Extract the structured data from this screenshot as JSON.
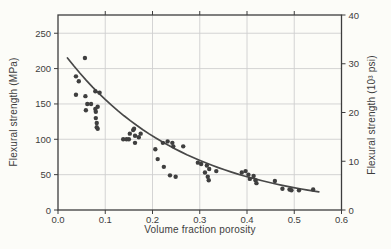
{
  "figure": {
    "background": "#fcfcf8",
    "axis_color": "#3d3d3d",
    "grid_color": "#cfcfcf",
    "point_color": "#3f3f3f",
    "curve_color": "#484848",
    "label_color": "#3d3d3d"
  },
  "chart_data": {
    "type": "scatter",
    "title": "",
    "xlabel": "Volume fraction porosity",
    "ylabel_left": "Flexural strength (MPa)",
    "ylabel_right": "Flexural strength (10³ psi)",
    "x_tick_labels": [
      "0.0",
      "0.1",
      "0.2",
      "0.3",
      "0.4",
      "0.5",
      "0.6"
    ],
    "x_tick_values": [
      0,
      0.1,
      0.2,
      0.3,
      0.4,
      0.5,
      0.6
    ],
    "left_tick_values": [
      0,
      50,
      100,
      150,
      200,
      250
    ],
    "right_tick_values": [
      0,
      10,
      20,
      30,
      40
    ],
    "xlim": [
      0,
      0.6
    ],
    "ylim_mpa": [
      0,
      275.8
    ],
    "ylim_psi": [
      0,
      40
    ],
    "grid": true,
    "legend_position": null,
    "points_mpa": [
      [
        0.038,
        189
      ],
      [
        0.044,
        182
      ],
      [
        0.057,
        215
      ],
      [
        0.038,
        163
      ],
      [
        0.058,
        161
      ],
      [
        0.062,
        150
      ],
      [
        0.07,
        150
      ],
      [
        0.059,
        141
      ],
      [
        0.079,
        168
      ],
      [
        0.088,
        166
      ],
      [
        0.084,
        146
      ],
      [
        0.079,
        143
      ],
      [
        0.08,
        139
      ],
      [
        0.08,
        130
      ],
      [
        0.082,
        123
      ],
      [
        0.082,
        117
      ],
      [
        0.084,
        115
      ],
      [
        0.138,
        100
      ],
      [
        0.145,
        100
      ],
      [
        0.15,
        100
      ],
      [
        0.152,
        108
      ],
      [
        0.159,
        113
      ],
      [
        0.161,
        115
      ],
      [
        0.163,
        105
      ],
      [
        0.163,
        95
      ],
      [
        0.171,
        103
      ],
      [
        0.175,
        108
      ],
      [
        0.206,
        86
      ],
      [
        0.211,
        72
      ],
      [
        0.222,
        95
      ],
      [
        0.224,
        61
      ],
      [
        0.232,
        97
      ],
      [
        0.242,
        95
      ],
      [
        0.244,
        90
      ],
      [
        0.237,
        49
      ],
      [
        0.249,
        47
      ],
      [
        0.265,
        90
      ],
      [
        0.296,
        67
      ],
      [
        0.303,
        65
      ],
      [
        0.311,
        53
      ],
      [
        0.315,
        63
      ],
      [
        0.317,
        47
      ],
      [
        0.319,
        42
      ],
      [
        0.32,
        58
      ],
      [
        0.335,
        55
      ],
      [
        0.389,
        53
      ],
      [
        0.397,
        55
      ],
      [
        0.403,
        50
      ],
      [
        0.406,
        44
      ],
      [
        0.414,
        48
      ],
      [
        0.418,
        42
      ],
      [
        0.42,
        38
      ],
      [
        0.459,
        41
      ],
      [
        0.475,
        30
      ],
      [
        0.49,
        29
      ],
      [
        0.494,
        28
      ],
      [
        0.51,
        28
      ],
      [
        0.54,
        29
      ]
    ],
    "fit_curve": {
      "model": "strength_MPa = A * exp(-k * volume_fraction)",
      "A": 233,
      "k": 4.0,
      "v_start": 0.02,
      "v_end": 0.552
    }
  }
}
